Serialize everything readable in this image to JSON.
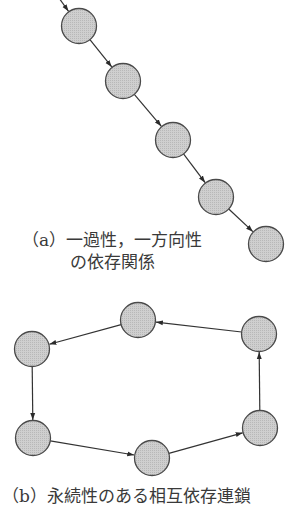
{
  "colors": {
    "node_fill": "#c9c9c9",
    "node_stroke": "#4a4a4a",
    "edge": "#333333",
    "background": "#ffffff"
  },
  "diagram_a": {
    "caption_line1": "（a）一過性，一方向性",
    "caption_line2": "の依存関係",
    "type": "linear-chain",
    "nodes": [
      {
        "id": "a1",
        "x": 79,
        "y": 26
      },
      {
        "id": "a2",
        "x": 123,
        "y": 81
      },
      {
        "id": "a3",
        "x": 173,
        "y": 140
      },
      {
        "id": "a4",
        "x": 216,
        "y": 197
      },
      {
        "id": "a5",
        "x": 266,
        "y": 244
      }
    ],
    "edges": [
      {
        "from": "in",
        "to": "a1"
      },
      {
        "from": "a1",
        "to": "a2"
      },
      {
        "from": "a2",
        "to": "a3"
      },
      {
        "from": "a3",
        "to": "a4"
      },
      {
        "from": "a4",
        "to": "a5"
      }
    ]
  },
  "diagram_b": {
    "caption": "（b）永続性のある相互依存連鎖",
    "type": "cycle",
    "nodes": [
      {
        "id": "b1",
        "x": 138,
        "y": 320
      },
      {
        "id": "b2",
        "x": 32,
        "y": 349
      },
      {
        "id": "b3",
        "x": 33,
        "y": 438
      },
      {
        "id": "b4",
        "x": 152,
        "y": 458
      },
      {
        "id": "b5",
        "x": 260,
        "y": 428
      },
      {
        "id": "b6",
        "x": 259,
        "y": 334
      }
    ],
    "edges": [
      {
        "from": "b1",
        "to": "b2"
      },
      {
        "from": "b2",
        "to": "b3"
      },
      {
        "from": "b3",
        "to": "b4"
      },
      {
        "from": "b4",
        "to": "b5"
      },
      {
        "from": "b5",
        "to": "b6"
      },
      {
        "from": "b6",
        "to": "b1"
      }
    ]
  }
}
